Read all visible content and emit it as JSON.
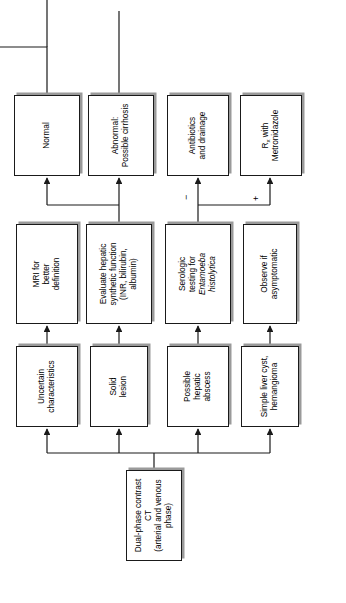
{
  "diagram": {
    "orientation": "rotated-90-ccw",
    "line_color": "#1a1a1a",
    "box_fill": "#ffffff",
    "shadow_color": "#9a9a9a"
  },
  "nodes": {
    "root": {
      "line1": "Dual-phase contrast CT",
      "line2": "(arterial and venous phase)"
    },
    "branch1": {
      "line1": "Simple liver cyst,",
      "line2": "hemangioma"
    },
    "branch2": {
      "line1": "Possible",
      "line2": "hepatic",
      "line3": "abscess"
    },
    "branch3": {
      "line1": "Solid",
      "line2": "lesion"
    },
    "branch4": {
      "line1": "Uncertain",
      "line2": "characteristics"
    },
    "step1": {
      "line1": "Observe if",
      "line2": "asymptomatic"
    },
    "step2": {
      "line1": "Serologic",
      "line2": "testing for",
      "line3": "Entamoeba",
      "line4": "histolytica"
    },
    "step3": {
      "line1": "Evaluate hepatic",
      "line2": "synthetic function",
      "line3": "(INR, bilirubin,",
      "line4": "albumin)"
    },
    "step4": {
      "line1": "MRI for",
      "line2": "better",
      "line3": "definition"
    },
    "outcome1": {
      "line1": "R",
      "sub1": "x",
      "line1b": " with",
      "line2": "Metronidazole"
    },
    "outcome2": {
      "line1": "Antibiotics",
      "line2": "and drainage"
    },
    "outcome3": {
      "line1": "Abnormal:",
      "line2": "Possible cirrhosis"
    },
    "outcome4": {
      "line1": "Normal"
    }
  },
  "edge_labels": {
    "positive": "+",
    "negative": "−"
  }
}
